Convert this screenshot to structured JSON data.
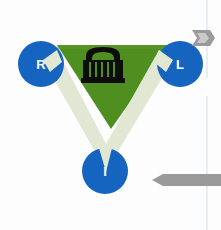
{
  "canvas": {
    "width": 221,
    "height": 230,
    "background_color": "#fdfdfd"
  },
  "diagram": {
    "title": "",
    "shape_name": "inverted-triangle-triad",
    "colors": {
      "node_blue": "#1565c0",
      "triangle_green": "#4e8f20",
      "chevron_cream": "#e2e7d4",
      "icon_black": "#0d0d0d",
      "arrow_gray": "#9a9a9a",
      "divider_blue": "#dbe6f2",
      "background": "#fdfdfd"
    },
    "center_icon": {
      "name": "classical-building-icon",
      "label": ""
    },
    "nodes": [
      {
        "id": "node-r",
        "label": "R",
        "position": "top-left",
        "cx": 41,
        "cy": 64,
        "r": 23
      },
      {
        "id": "node-l",
        "label": "L",
        "position": "top-right",
        "cx": 180,
        "cy": 64,
        "r": 23
      },
      {
        "id": "node-i",
        "label": "I",
        "position": "bottom",
        "cx": 105,
        "cy": 171,
        "r": 23
      }
    ],
    "triangle": {
      "points": "57,45 170,45 111,128",
      "orientation": "inverted"
    },
    "chevron": {
      "name": "v-chevron-connector",
      "outer_points": "44,62 105,168 172,62 160,52 105,142 56,52"
    }
  },
  "markers": {
    "arrow_top_right": {
      "name": "chevron-right-arrow",
      "direction": "right",
      "x": 192,
      "y": 30,
      "width": 23,
      "height": 16
    },
    "arrow_bottom_right": {
      "name": "long-left-arrow",
      "direction": "left",
      "x": 152,
      "y": 174,
      "width": 69,
      "height": 12
    }
  },
  "dividers": [
    {
      "name": "right-vertical-divider-upper",
      "x": 207,
      "y1": 0,
      "y2": 78
    },
    {
      "name": "right-vertical-divider-lower",
      "x": 207,
      "y1": 96,
      "y2": 230
    }
  ]
}
